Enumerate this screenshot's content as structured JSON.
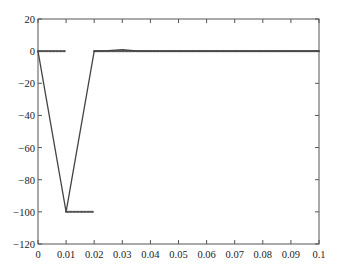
{
  "chart_data": {
    "type": "line",
    "title": "",
    "xlabel": "",
    "ylabel": "",
    "xlim": [
      0,
      0.1
    ],
    "ylim": [
      -120,
      20
    ],
    "grid": false,
    "legend": null,
    "x_ticks": [
      "0",
      "0.01",
      "0.02",
      "0.03",
      "0.04",
      "0.05",
      "0.06",
      "0.07",
      "0.08",
      "0.09",
      "0.1"
    ],
    "y_ticks": [
      "20",
      "0",
      "−20",
      "−40",
      "−60",
      "−80",
      "−100",
      "−120"
    ],
    "series": [
      {
        "name": "response",
        "style": "line",
        "color": "#444444",
        "points": [
          [
            0,
            0
          ],
          [
            0.01,
            -100
          ],
          [
            0.02,
            0
          ],
          [
            0.025,
            0.3
          ],
          [
            0.03,
            1
          ],
          [
            0.035,
            0.2
          ],
          [
            0.04,
            0
          ],
          [
            0.1,
            0
          ]
        ]
      },
      {
        "name": "samples",
        "style": "markers",
        "color": "#555555",
        "segments": [
          {
            "x_start": 0,
            "x_end": 0.0095,
            "y": 0
          },
          {
            "x_start": 0.01,
            "x_end": 0.0195,
            "y": -100
          },
          {
            "x_start": 0.02,
            "x_end": 0.1,
            "y": 0
          }
        ],
        "step": 0.0005
      }
    ]
  }
}
